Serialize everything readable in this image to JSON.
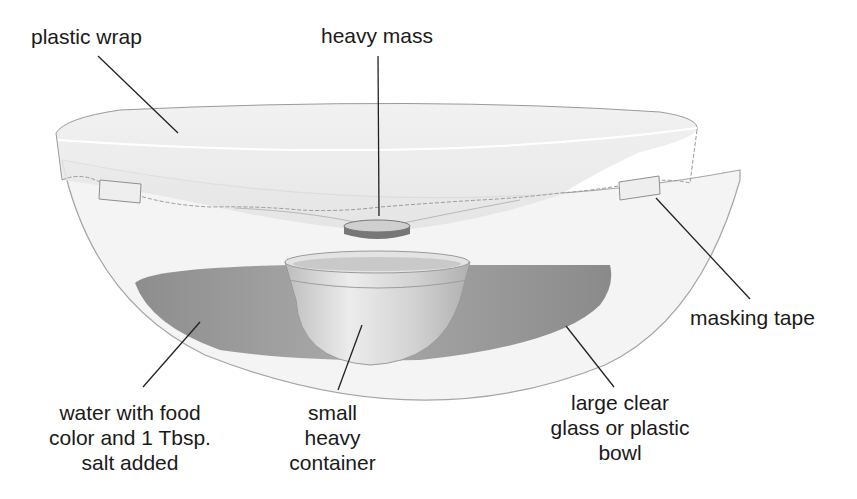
{
  "labels": {
    "plastic_wrap": "plastic wrap",
    "heavy_mass": "heavy mass",
    "masking_tape": "masking tape",
    "water": [
      "water with food",
      "color and 1 Tbsp.",
      "salt added"
    ],
    "small_container": [
      "small",
      "heavy",
      "container"
    ],
    "large_bowl": [
      "large clear",
      "glass or plastic",
      "bowl"
    ]
  },
  "colors": {
    "background": "#ffffff",
    "text": "#1a1a1a",
    "leader_line": "#222222",
    "bowl_fill": "#f2f2f2",
    "bowl_outline": "#9a9a9a",
    "wrap_fill": "#e9e9e9",
    "water_dark": "#8f8f8f",
    "water_light": "#b5b5b5",
    "container_fill": "#d6d6d6",
    "mass_fill": "#7a7a7a"
  }
}
